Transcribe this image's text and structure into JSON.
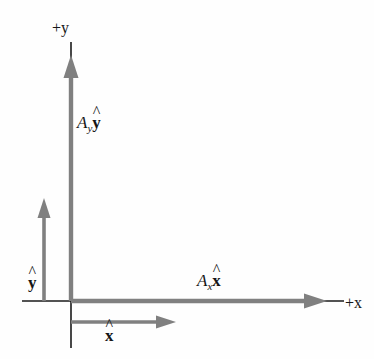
{
  "figure": {
    "width": 374,
    "height": 359,
    "background_color": "#fefefe",
    "axis_color": "#1a1a1a",
    "vector_color": "#808080",
    "label_color": "#161616"
  },
  "axes": {
    "y_axis": {
      "label": "+y",
      "label_sign": "+",
      "label_variable": "y",
      "orientation": "vertical",
      "origin_x": 71,
      "top_y": 42,
      "bottom_y": 348
    },
    "x_axis": {
      "label": "+x",
      "label_sign": "+",
      "label_variable": "x",
      "orientation": "horizontal",
      "origin_y": 301,
      "left_x": 22,
      "right_x": 344
    }
  },
  "vectors": [
    {
      "name": "a-y-component",
      "label_amplitude": "A",
      "label_subscript": "y",
      "label_unit": "y",
      "label_text": "A_y ŷ",
      "direction": "up",
      "start": [
        71,
        301
      ],
      "end": [
        71,
        57
      ],
      "color": "#808080"
    },
    {
      "name": "a-x-component",
      "label_amplitude": "A",
      "label_subscript": "x",
      "label_unit": "x",
      "label_text": "A_x x̂",
      "direction": "right",
      "start": [
        71,
        301
      ],
      "end": [
        326,
        301
      ],
      "color": "#808080"
    },
    {
      "name": "y-unit-vector",
      "label_unit": "y",
      "label_text": "ŷ",
      "direction": "up",
      "start": [
        44,
        301
      ],
      "end": [
        44,
        199
      ],
      "color": "#808080"
    },
    {
      "name": "x-unit-vector",
      "label_unit": "x",
      "label_text": "x̂",
      "direction": "right",
      "start": [
        71,
        322
      ],
      "end": [
        176,
        322
      ],
      "color": "#808080"
    }
  ],
  "labels": {
    "positive_y": "+y",
    "positive_x": "+x",
    "a_y_amplitude": "A",
    "a_y_subscript": "y",
    "a_y_unit": "y",
    "a_x_amplitude": "A",
    "a_x_subscript": "x",
    "a_x_unit": "x",
    "y_hat": "y",
    "x_hat": "x",
    "hat_glyph": "^"
  }
}
